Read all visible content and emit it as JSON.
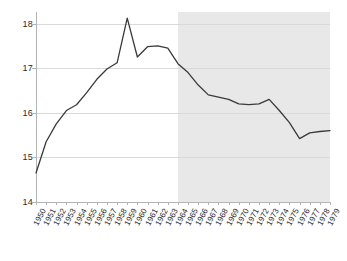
{
  "chart_data": {
    "type": "line",
    "title": "",
    "subtitle": "",
    "xlabel": "",
    "ylabel": "",
    "xlim": [
      1950,
      1979
    ],
    "ylim": [
      14,
      18.45
    ],
    "yticks": [
      14,
      15,
      16,
      17,
      18
    ],
    "ytick_labels": [
      "14",
      "15",
      "16",
      "17",
      "18"
    ],
    "grid": "horizontal",
    "legend": "none",
    "x": [
      1950,
      1951,
      1952,
      1953,
      1954,
      1955,
      1956,
      1957,
      1958,
      1959,
      1960,
      1961,
      1962,
      1963,
      1964,
      1965,
      1966,
      1967,
      1968,
      1969,
      1970,
      1971,
      1972,
      1973,
      1974,
      1975,
      1976,
      1977,
      1978,
      1979
    ],
    "xtick_labels": [
      "1950",
      "1951",
      "1952",
      "1953",
      "1954",
      "1955",
      "1956",
      "1957",
      "1958",
      "1959",
      "1960",
      "1961",
      "1962",
      "1963",
      "1964",
      "1965",
      "1966",
      "1967",
      "1968",
      "1969",
      "1970",
      "1971",
      "1972",
      "1973",
      "1974",
      "1975",
      "1976",
      "1977",
      "1978",
      "1979"
    ],
    "series": [
      {
        "name": "rate",
        "color": "#3a3a3a",
        "values": [
          14.65,
          15.35,
          15.75,
          16.05,
          16.18,
          16.45,
          16.75,
          16.98,
          17.12,
          18.12,
          17.25,
          17.48,
          17.5,
          17.45,
          17.1,
          16.9,
          16.62,
          16.4,
          16.35,
          16.3,
          16.2,
          16.18,
          16.2,
          16.3,
          16.05,
          15.78,
          15.42,
          15.55,
          15.58,
          15.6
        ]
      }
    ],
    "shaded_region": {
      "label": "",
      "x_start": 1964,
      "x_end": 1979,
      "color": "#e8e8e8"
    },
    "axis_color": "#b4b4b4",
    "grid_color": "#d9d9d9",
    "background": "#ffffff"
  }
}
